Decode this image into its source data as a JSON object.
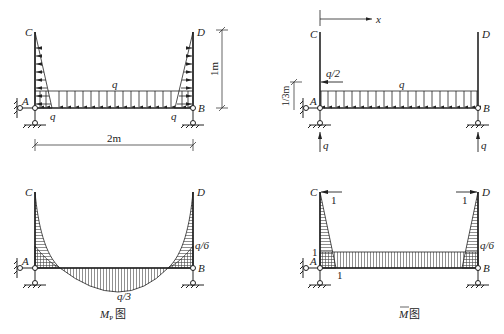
{
  "figure": {
    "panels": [
      {
        "id": "load-diagram",
        "nodes": {
          "C": "C",
          "D": "D",
          "A": "A",
          "B": "B"
        },
        "load_labels": {
          "uniform": "q",
          "left_tri": "q",
          "right_tri": "q"
        },
        "dimensions": {
          "height": "1m",
          "span": "2m"
        }
      },
      {
        "id": "unit-load-diagram",
        "nodes": {
          "C": "C",
          "D": "D",
          "A": "A",
          "B": "B"
        },
        "axis_label": "x",
        "load_labels": {
          "uniform": "q",
          "horizontal": "q/2",
          "reaction_left": "q",
          "reaction_right": "q"
        },
        "dimensions": {
          "height": "1/3m"
        }
      },
      {
        "id": "mp-diagram",
        "nodes": {
          "C": "C",
          "D": "D",
          "A": "A",
          "B": "B"
        },
        "values": {
          "right_column": "q/6",
          "midspan": "q/3"
        },
        "caption_main": "M",
        "caption_sub": "P",
        "caption_suffix": "图"
      },
      {
        "id": "mbar-diagram",
        "nodes": {
          "C": "C",
          "D": "D",
          "A": "A",
          "B": "B"
        },
        "values": {
          "left_top_force": "1",
          "right_top_force": "1",
          "left_column": "1",
          "left_beam": "1",
          "right_column": "q/6"
        },
        "caption_main": "M",
        "caption_suffix": "图"
      }
    ]
  },
  "colors": {
    "line": "#222222",
    "hatch": "#444444",
    "background": "#ffffff"
  }
}
